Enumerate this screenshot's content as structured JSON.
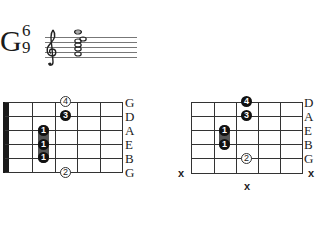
{
  "chord": {
    "root": "G",
    "superscript": "6",
    "subscript": "9",
    "notation": {
      "clef": "treble-clef",
      "staff_lines": 5
    }
  },
  "diagram_left": {
    "strings": [
      "G",
      "D",
      "A",
      "E",
      "B",
      "G"
    ],
    "fingers": [
      {
        "label": "4",
        "style": "open-circle",
        "string": 0,
        "fret": 3
      },
      {
        "label": "3",
        "style": "filled",
        "string": 1,
        "fret": 3
      },
      {
        "label": "1",
        "style": "filled",
        "string": 2,
        "fret": 2
      },
      {
        "label": "1",
        "style": "filled",
        "string": 3,
        "fret": 2
      },
      {
        "label": "1",
        "style": "filled",
        "string": 4,
        "fret": 2
      },
      {
        "label": "2",
        "style": "open-circle",
        "string": 5,
        "fret": 3
      }
    ],
    "has_nut": true
  },
  "diagram_right": {
    "strings": [
      "D",
      "A",
      "E",
      "B",
      "G"
    ],
    "fingers": [
      {
        "label": "4",
        "style": "filled",
        "string": 0,
        "fret": 3
      },
      {
        "label": "3",
        "style": "filled",
        "string": 1,
        "fret": 3
      },
      {
        "label": "1",
        "style": "filled",
        "string": 2,
        "fret": 2
      },
      {
        "label": "1",
        "style": "filled",
        "string": 3,
        "fret": 2
      },
      {
        "label": "2",
        "style": "open-circle",
        "string": 4,
        "fret": 3
      }
    ],
    "mutes": [
      "x",
      "x",
      "x"
    ]
  }
}
